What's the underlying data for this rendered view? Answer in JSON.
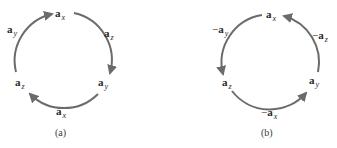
{
  "diagrams": [
    {
      "caption": "(a)",
      "labels": {
        "top": {
          "sign": "",
          "base": "a",
          "sub": "x"
        },
        "upper_left": {
          "sign": "",
          "base": "a",
          "sub": "y"
        },
        "upper_right": {
          "sign": "",
          "base": "a",
          "sub": "z"
        },
        "lower_left": {
          "sign": "",
          "base": "a",
          "sub": "z"
        },
        "lower_right": {
          "sign": "",
          "base": "a",
          "sub": "y"
        },
        "bottom": {
          "sign": "",
          "base": "a",
          "sub": "x"
        }
      },
      "direction": "clockwise"
    },
    {
      "caption": "(b)",
      "labels": {
        "top": {
          "sign": "",
          "base": "a",
          "sub": "x"
        },
        "upper_left": {
          "sign": "−",
          "base": "a",
          "sub": "y"
        },
        "upper_right": {
          "sign": "−",
          "base": "a",
          "sub": "z"
        },
        "lower_left": {
          "sign": "",
          "base": "a",
          "sub": "z"
        },
        "lower_right": {
          "sign": "",
          "base": "a",
          "sub": "y"
        },
        "bottom": {
          "sign": "−",
          "base": "a",
          "sub": "x"
        }
      },
      "direction": "counterclockwise"
    }
  ],
  "colors": {
    "arc": "#6b6b6b",
    "text": "#2a2a2a"
  }
}
